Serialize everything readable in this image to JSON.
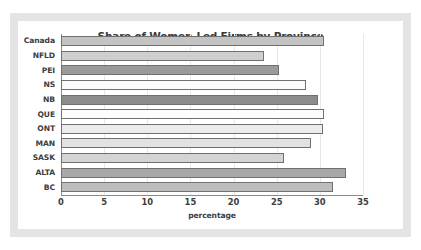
{
  "chart_data": {
    "type": "bar",
    "orientation": "horizontal",
    "title": "Share of Women-Led Firms by Province",
    "xlabel": "percentage",
    "ylabel": "",
    "xlim": [
      0,
      35
    ],
    "xticks": [
      0,
      5,
      10,
      15,
      20,
      25,
      30,
      35
    ],
    "grid": true,
    "legend": "none",
    "categories": [
      "Canada",
      "NFLD",
      "PEI",
      "NS",
      "NB",
      "QUE",
      "ONT",
      "MAN",
      "SASK",
      "ALTA",
      "BC"
    ],
    "values": [
      30.5,
      23.5,
      25.3,
      28.4,
      29.8,
      30.5,
      30.4,
      29.0,
      25.9,
      33.0,
      31.5
    ],
    "bar_colors": [
      "#c3c3c3",
      "#cfcfcf",
      "#9a9a9a",
      "#fbfbfb",
      "#8c8c8c",
      "#fdfdfd",
      "#ececec",
      "#e2e2e2",
      "#d4d4d4",
      "#a8a8a8",
      "#bdbdbd"
    ]
  },
  "style": {
    "frame_color": "#e4e4e4",
    "panel_color": "#ffffff",
    "axis_color": "#8a8a8a",
    "gridline_color": "#e8e8e8",
    "text_color": "#3d3d3d",
    "title_color": "#3a3a3a",
    "bar_border_color": "#707070"
  }
}
